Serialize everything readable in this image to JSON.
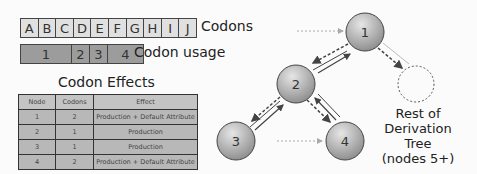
{
  "codons": {
    "label": "Codons",
    "cells": [
      "A",
      "B",
      "C",
      "D",
      "E",
      "F",
      "G",
      "H",
      "I",
      "J"
    ]
  },
  "usage": {
    "label": "Codon usage",
    "cells": [
      {
        "text": "1",
        "width": 50
      },
      {
        "text": "2",
        "width": 17
      },
      {
        "text": "3",
        "width": 17
      },
      {
        "text": "4",
        "width": 35
      }
    ]
  },
  "effects": {
    "title": "Codon Effects",
    "headers": [
      "Node",
      "Codons",
      "Effect"
    ],
    "rows": [
      [
        "1",
        "2",
        "Production + Default Attribute"
      ],
      [
        "2",
        "1",
        "Production"
      ],
      [
        "3",
        "1",
        "Production"
      ],
      [
        "4",
        "2",
        "Production + Default Attribute"
      ]
    ]
  },
  "tree": {
    "nodes": [
      "1",
      "2",
      "3",
      "4"
    ],
    "rest_label": [
      "Rest of",
      "Derivation Tree",
      "(nodes 5+)"
    ]
  },
  "colors": {
    "codon_fill": "#e0e0e0",
    "usage_fill": "#9c9c9c",
    "node_fill": "#a8a8a8"
  }
}
